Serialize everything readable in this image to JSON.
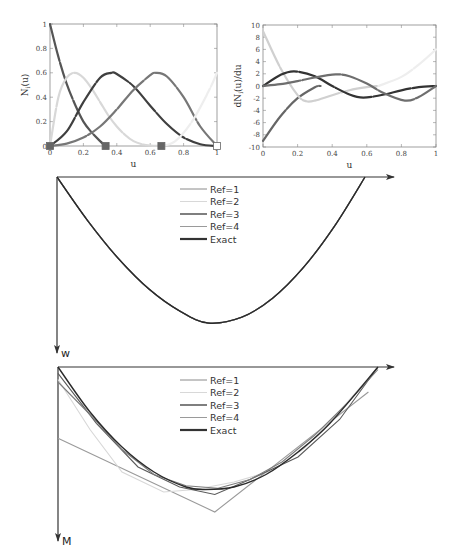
{
  "chart_data": [
    {
      "id": "basis-functions",
      "type": "line",
      "title": "",
      "xlabel": "u",
      "ylabel": "N_i(u)",
      "xlim": [
        0,
        1
      ],
      "ylim": [
        0,
        1
      ],
      "xticks": [
        "0",
        "0.2",
        "0.4",
        "0.6",
        "0.8",
        "1"
      ],
      "yticks": [
        "0",
        "0.2",
        "0.4",
        "0.6",
        "0.8",
        "1"
      ],
      "grid": false,
      "knots_markers": [
        0,
        0.333,
        0.667,
        1
      ],
      "series": [
        {
          "name": "N1",
          "color": "#555555",
          "x": [
            0,
            0.05,
            0.1,
            0.15,
            0.2,
            0.25,
            0.3,
            0.333
          ],
          "y": [
            1,
            0.73,
            0.51,
            0.34,
            0.2,
            0.11,
            0.04,
            0
          ]
        },
        {
          "name": "N2",
          "color": "#d8d8d8",
          "x": [
            0,
            0.05,
            0.1,
            0.15,
            0.2,
            0.25,
            0.3,
            0.35,
            0.4,
            0.45,
            0.5,
            0.55,
            0.6,
            0.667
          ],
          "y": [
            0,
            0.4,
            0.56,
            0.6,
            0.56,
            0.47,
            0.36,
            0.25,
            0.16,
            0.09,
            0.04,
            0.015,
            0.003,
            0
          ]
        },
        {
          "name": "N3",
          "color": "#3f3f3f",
          "x": [
            0,
            0.1,
            0.2,
            0.3,
            0.367,
            0.4,
            0.5,
            0.6,
            0.7,
            0.8,
            0.9,
            1
          ],
          "y": [
            0,
            0.12,
            0.36,
            0.56,
            0.6,
            0.59,
            0.49,
            0.33,
            0.18,
            0.07,
            0.015,
            0
          ]
        },
        {
          "name": "N4",
          "color": "#777777",
          "x": [
            0,
            0.1,
            0.2,
            0.3,
            0.4,
            0.5,
            0.6,
            0.633,
            0.7,
            0.8,
            0.9,
            1
          ],
          "y": [
            0,
            0.02,
            0.07,
            0.16,
            0.3,
            0.46,
            0.58,
            0.6,
            0.57,
            0.4,
            0.16,
            0
          ]
        },
        {
          "name": "N5",
          "color": "#eeeeee",
          "x": [
            0.667,
            0.75,
            0.85,
            0.95,
            1
          ],
          "y": [
            0,
            0.04,
            0.2,
            0.45,
            0.6
          ]
        }
      ]
    },
    {
      "id": "basis-derivatives",
      "type": "line",
      "title": "",
      "xlabel": "u",
      "ylabel": "dN_i(u)/du",
      "xlim": [
        0,
        1
      ],
      "ylim": [
        -10,
        10
      ],
      "xticks": [
        "0",
        "0.2",
        "0.4",
        "0.6",
        "0.8",
        "1"
      ],
      "yticks": [
        "-10",
        "-8",
        "-6",
        "-4",
        "-2",
        "0",
        "2",
        "4",
        "6",
        "8",
        "10"
      ],
      "grid": false,
      "series": [
        {
          "name": "dN1",
          "color": "#666666",
          "x": [
            0,
            0.1,
            0.2,
            0.3,
            0.333
          ],
          "y": [
            -9,
            -5,
            -2,
            -0.2,
            0
          ]
        },
        {
          "name": "dN2",
          "color": "#d0d0d0",
          "x": [
            0,
            0.1,
            0.2,
            0.25,
            0.3,
            0.4,
            0.5,
            0.6,
            0.667
          ],
          "y": [
            9,
            3,
            -1.5,
            -2.5,
            -2.4,
            -1.5,
            -0.7,
            -0.2,
            0
          ]
        },
        {
          "name": "dN3",
          "color": "#333333",
          "x": [
            0,
            0.1,
            0.18,
            0.3,
            0.4,
            0.5,
            0.58,
            0.7,
            0.8,
            0.9,
            1
          ],
          "y": [
            0,
            1.8,
            2.4,
            1.6,
            0,
            -1.4,
            -1.9,
            -1.4,
            -0.7,
            -0.2,
            0
          ]
        },
        {
          "name": "dN4",
          "color": "#6e6e6e",
          "x": [
            0,
            0.1,
            0.2,
            0.3,
            0.42,
            0.5,
            0.6,
            0.7,
            0.82,
            0.9,
            1
          ],
          "y": [
            0,
            0.3,
            0.8,
            1.4,
            1.9,
            1.6,
            0.4,
            -1.2,
            -2.4,
            -1.8,
            0
          ]
        },
        {
          "name": "dN5",
          "color": "#eeeeee",
          "x": [
            0.667,
            0.8,
            0.9,
            1
          ],
          "y": [
            0,
            1.5,
            3.5,
            6
          ]
        }
      ]
    },
    {
      "id": "deflection-w",
      "type": "line",
      "title": "",
      "xlabel": "",
      "ylabel": "w",
      "legend_position": "top-center",
      "legend": [
        "Ref=1",
        "Ref=2",
        "Ref=3",
        "Ref=4",
        "Exact"
      ],
      "note": "all refinements coincide with exact parabolic deflection; y-axis points downward",
      "series": [
        {
          "name": "Ref=1",
          "color": "#8a8a8a"
        },
        {
          "name": "Ref=2",
          "color": "#d6d6d6"
        },
        {
          "name": "Ref=3",
          "color": "#555555"
        },
        {
          "name": "Ref=4",
          "color": "#9a9a9a"
        },
        {
          "name": "Exact",
          "color": "#2a2a2a",
          "x": [
            0,
            0.1,
            0.2,
            0.3,
            0.4,
            0.49,
            0.6,
            0.7,
            0.8,
            0.9,
            1
          ],
          "y": [
            0,
            0.3,
            0.56,
            0.77,
            0.92,
            1.0,
            0.96,
            0.83,
            0.62,
            0.34,
            0
          ]
        }
      ]
    },
    {
      "id": "moment-m",
      "type": "line",
      "title": "",
      "xlabel": "",
      "ylabel": "M",
      "legend_position": "top-center",
      "legend": [
        "Ref=1",
        "Ref=2",
        "Ref=3",
        "Ref=4",
        "Exact"
      ],
      "note": "piecewise approximations converge to exact parabolic moment; y-axis points downward",
      "series": [
        {
          "name": "Ref=1",
          "color": "#9a9a9a",
          "x": [
            0,
            0.49,
            0.97
          ],
          "y": [
            0.57,
            1.16,
            0.2
          ]
        },
        {
          "name": "Ref=2",
          "color": "#d8d8d8",
          "x": [
            0,
            0.1,
            0.2,
            0.33,
            0.43,
            0.55,
            0.67,
            0.77,
            0.87,
            1
          ],
          "y": [
            0.1,
            0.5,
            0.84,
            1.0,
            0.98,
            0.92,
            0.83,
            0.65,
            0.38,
            0
          ]
        },
        {
          "name": "Ref=3",
          "color": "#5a5a5a",
          "x": [
            0,
            0.12,
            0.25,
            0.38,
            0.49,
            0.6,
            0.75,
            0.88,
            1
          ],
          "y": [
            0.05,
            0.45,
            0.8,
            0.96,
            1.02,
            0.9,
            0.72,
            0.42,
            0
          ]
        },
        {
          "name": "Ref=4",
          "color": "#7d7d7d",
          "x": [
            0,
            0.1,
            0.2,
            0.3,
            0.4,
            0.5,
            0.6,
            0.7,
            0.8,
            0.9,
            1
          ],
          "y": [
            0.12,
            0.38,
            0.66,
            0.86,
            0.95,
            0.97,
            0.9,
            0.76,
            0.55,
            0.3,
            0.02
          ]
        },
        {
          "name": "Exact",
          "color": "#2a2a2a",
          "x": [
            0,
            0.1,
            0.2,
            0.3,
            0.4,
            0.46,
            0.55,
            0.65,
            0.75,
            0.85,
            1
          ],
          "y": [
            0,
            0.36,
            0.64,
            0.84,
            0.96,
            0.98,
            0.96,
            0.86,
            0.68,
            0.45,
            0
          ]
        }
      ]
    }
  ],
  "labels": {
    "top_left": {
      "xlabel": "u",
      "ylabel_main": "N",
      "ylabel_sub": "i",
      "ylabel_tail": "(u)"
    },
    "top_right": {
      "xlabel": "u",
      "ylabel_main": "dN",
      "ylabel_sub": "i",
      "ylabel_tail": "(u)/du"
    },
    "w_axis": "w",
    "m_axis": "M"
  },
  "legend": {
    "items": [
      {
        "label": "Ref=1",
        "color": "#8a8a8a",
        "width": 1
      },
      {
        "label": "Ref=2",
        "color": "#d8d8d8",
        "width": 1
      },
      {
        "label": "Ref=3",
        "color": "#555555",
        "width": 1.5
      },
      {
        "label": "Ref=4",
        "color": "#9a9a9a",
        "width": 1
      },
      {
        "label": "Exact",
        "color": "#333333",
        "width": 2.2
      }
    ]
  }
}
